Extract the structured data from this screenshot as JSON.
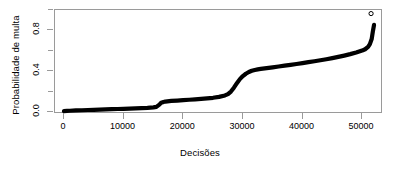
{
  "chart_data": {
    "type": "line",
    "title": "",
    "xlabel": "Decisões",
    "ylabel": "Probabilidade de multa",
    "xlim": [
      -1500,
      53500
    ],
    "ylim": [
      -0.02,
      1.0
    ],
    "grid": false,
    "legend": null,
    "x_ticks": [
      {
        "value": 0,
        "label": "0"
      },
      {
        "value": 10000,
        "label": "10000"
      },
      {
        "value": 20000,
        "label": "20000"
      },
      {
        "value": 30000,
        "label": "30000"
      },
      {
        "value": 40000,
        "label": "40000"
      },
      {
        "value": 50000,
        "label": "50000"
      }
    ],
    "y_ticks": [
      {
        "value": 0.0,
        "label": "0.0",
        "major": true
      },
      {
        "value": 0.2,
        "label": "",
        "major": false
      },
      {
        "value": 0.4,
        "label": "0.4",
        "major": true
      },
      {
        "value": 0.6,
        "label": "",
        "major": false
      },
      {
        "value": 0.8,
        "label": "0.8",
        "major": true
      },
      {
        "value": 1.0,
        "label": "",
        "major": false
      }
    ],
    "series": [
      {
        "name": "Probabilidade de multa ordenada",
        "style": "dense-points",
        "color": "#000000",
        "x": [
          0,
          500,
          1000,
          2000,
          3000,
          4000,
          5000,
          6000,
          7000,
          8000,
          9000,
          10000,
          11000,
          12000,
          13000,
          14000,
          15000,
          15500,
          16000,
          16300,
          16700,
          17000,
          18000,
          19000,
          20000,
          21000,
          22000,
          23000,
          24000,
          25000,
          26000,
          27000,
          27500,
          28000,
          28500,
          29000,
          29500,
          30000,
          30500,
          31000,
          31500,
          32000,
          32500,
          33000,
          34000,
          35000,
          36000,
          37000,
          38000,
          39000,
          40000,
          41000,
          42000,
          43000,
          44000,
          45000,
          46000,
          47000,
          48000,
          49000,
          50000,
          50500,
          51000,
          51300,
          51600,
          51800,
          52000
        ],
        "y": [
          0.008,
          0.01,
          0.012,
          0.015,
          0.017,
          0.019,
          0.021,
          0.023,
          0.025,
          0.027,
          0.029,
          0.031,
          0.033,
          0.035,
          0.037,
          0.04,
          0.045,
          0.05,
          0.072,
          0.09,
          0.098,
          0.102,
          0.108,
          0.112,
          0.116,
          0.12,
          0.124,
          0.128,
          0.133,
          0.139,
          0.148,
          0.162,
          0.175,
          0.2,
          0.238,
          0.282,
          0.322,
          0.352,
          0.375,
          0.392,
          0.404,
          0.412,
          0.418,
          0.422,
          0.43,
          0.438,
          0.446,
          0.454,
          0.462,
          0.47,
          0.479,
          0.488,
          0.497,
          0.507,
          0.517,
          0.528,
          0.54,
          0.553,
          0.567,
          0.583,
          0.602,
          0.615,
          0.638,
          0.665,
          0.715,
          0.79,
          0.855
        ]
      },
      {
        "name": "Ponto destacado",
        "style": "open-circle",
        "color": "#000000",
        "x": [
          51500
        ],
        "y": [
          0.965
        ]
      }
    ]
  }
}
